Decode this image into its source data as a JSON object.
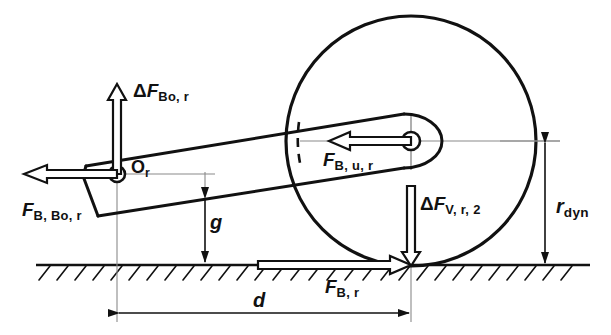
{
  "figure": {
    "type": "technical-engineering-diagram",
    "background_color": "#ffffff",
    "line_color": "#111111",
    "width": 611,
    "height": 335
  },
  "labels": {
    "delta_f_bo_r": {
      "prefix": "Δ",
      "symbol": "F",
      "sub": "Bo, r"
    },
    "f_b_bo_r": {
      "prefix": "",
      "symbol": "F",
      "sub": "B, Bo, r"
    },
    "f_b_u_r": {
      "prefix": "",
      "symbol": "F",
      "sub": "B, u, r"
    },
    "delta_f_v_r_2": {
      "prefix": "Δ",
      "symbol": "F",
      "sub": "V, r, 2"
    },
    "f_b_r": {
      "prefix": "",
      "symbol": "F",
      "sub": "B, r"
    },
    "point_o_r": {
      "prefix": "",
      "symbol": "O",
      "sub": "r"
    },
    "r_dyn": {
      "prefix": "",
      "symbol": "r",
      "sub": "dyn"
    },
    "dim_g": {
      "prefix": "",
      "symbol": "g",
      "sub": ""
    },
    "dim_d": {
      "prefix": "",
      "symbol": "d",
      "sub": ""
    }
  },
  "geometry": {
    "wheel": {
      "cx": 411,
      "cy": 141,
      "r": 125
    },
    "hub": {
      "cx": 411,
      "cy": 141,
      "r": 9
    },
    "pivot": {
      "cx": 117,
      "cy": 174,
      "r": 8
    },
    "ground_y": 265,
    "contact_patch_x": 411,
    "dim_d_y": 310,
    "dim_g_x": 205,
    "dim_rdyn_x": 545
  },
  "colors": {
    "ink": "#111111",
    "thin": "#6d6d6d",
    "paper": "#ffffff"
  }
}
